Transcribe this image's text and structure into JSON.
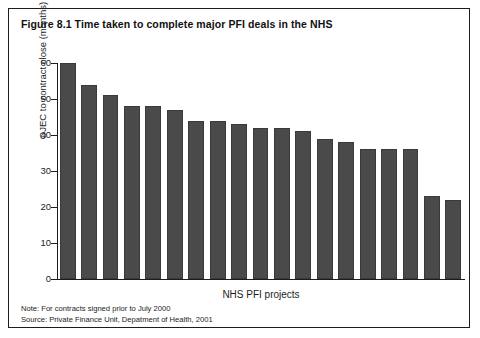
{
  "figure": {
    "title": "Figure 8.1 Time taken to complete major PFI deals in the NHS",
    "note": "Note:  For contracts signed prior to July 2000",
    "source": "Source: Private Finance Unit, Depatment of Health, 2001"
  },
  "colors": {
    "bar_fill": "#4a4a4a",
    "bar_edge": "#3a3a3a",
    "axis": "#1c1c1c",
    "background": "#ffffff",
    "border": "#1c1c1c"
  },
  "chart_data": {
    "type": "bar",
    "title": "Figure 8.1 Time taken to complete major PFI deals in the NHS",
    "xlabel": "NHS PFI projects",
    "ylabel": "OJEC to contract close (months)",
    "ylim": [
      0,
      60
    ],
    "yticks": [
      0,
      10,
      20,
      30,
      40,
      50,
      60
    ],
    "ytick_labels": [
      "0",
      "10",
      "20",
      "30",
      "40",
      "50",
      "60"
    ],
    "grid": false,
    "legend": false,
    "categories": [
      "Project 1",
      "Project 2",
      "Project 3",
      "Project 4",
      "Project 5",
      "Project 6",
      "Project 7",
      "Project 8",
      "Project 9",
      "Project 10",
      "Project 11",
      "Project 12",
      "Project 13",
      "Project 14",
      "Project 15",
      "Project 16",
      "Project 17",
      "Project 18",
      "Project 19"
    ],
    "values": [
      60,
      54,
      51,
      48,
      48,
      47,
      44,
      44,
      43,
      42,
      42,
      41,
      39,
      38,
      36,
      36,
      36,
      23,
      22
    ]
  }
}
